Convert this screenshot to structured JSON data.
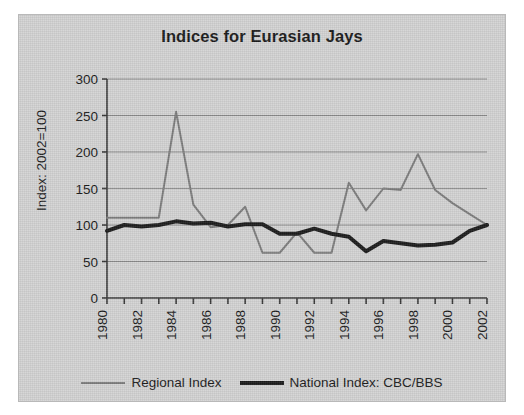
{
  "chart_data": {
    "type": "line",
    "title": "Indices for Eurasian Jays",
    "xlabel": "",
    "ylabel": "Index: 2002=100",
    "ylim": [
      0,
      300
    ],
    "xlim": [
      1980,
      2002
    ],
    "yticks": [
      0,
      50,
      100,
      150,
      200,
      250,
      300
    ],
    "ytick_labels": [
      "0",
      "50",
      "100",
      "150",
      "200",
      "250",
      "300"
    ],
    "x": [
      1980,
      1981,
      1982,
      1983,
      1984,
      1985,
      1986,
      1987,
      1988,
      1989,
      1990,
      1991,
      1992,
      1993,
      1994,
      1995,
      1996,
      1997,
      1998,
      1999,
      2000,
      2001,
      2002
    ],
    "xtick_labels": [
      "1980",
      "",
      "1982",
      "",
      "1984",
      "",
      "1986",
      "",
      "1988",
      "",
      "1990",
      "",
      "1992",
      "",
      "1994",
      "",
      "1996",
      "",
      "1998",
      "",
      "2000",
      "",
      "2002"
    ],
    "grid": "horizontal",
    "legend_position": "bottom",
    "series": [
      {
        "name": "Regional Index",
        "color": "#7d7d7d",
        "width": 2,
        "values": [
          110,
          110,
          110,
          110,
          255,
          128,
          97,
          100,
          125,
          62,
          62,
          90,
          62,
          62,
          158,
          120,
          150,
          148,
          197,
          148,
          130,
          115,
          100
        ]
      },
      {
        "name": "National Index: CBC/BBS",
        "color": "#1c1c1c",
        "width": 4,
        "values": [
          92,
          100,
          98,
          100,
          105,
          102,
          103,
          98,
          101,
          101,
          88,
          88,
          95,
          88,
          84,
          64,
          78,
          75,
          72,
          73,
          76,
          92,
          100
        ]
      }
    ]
  },
  "figure": {
    "background": "#d3d3d3",
    "border_color": "#b9b9b9",
    "axis_color": "#3a3a3a",
    "grid_color": "#8a8a8a"
  },
  "legend": {
    "items": [
      {
        "label": "Regional Index"
      },
      {
        "label": "National Index: CBC/BBS"
      }
    ]
  }
}
